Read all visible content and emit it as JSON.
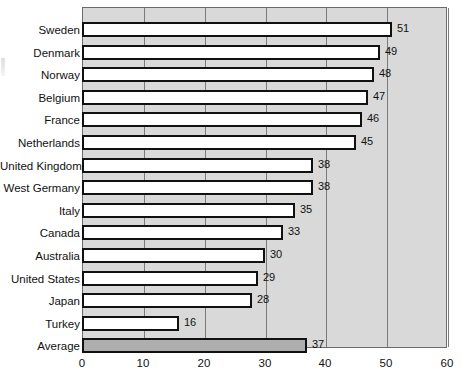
{
  "chart_data": {
    "type": "bar",
    "orientation": "horizontal",
    "title": "",
    "xlabel": "",
    "ylabel": "",
    "xlim": [
      0,
      60
    ],
    "xticks": [
      0,
      10,
      20,
      30,
      40,
      50,
      60
    ],
    "grid": true,
    "legend": false,
    "categories": [
      "Sweden",
      "Denmark",
      "Norway",
      "Belgium",
      "France",
      "Netherlands",
      "United Kingdom",
      "West Germany",
      "Italy",
      "Canada",
      "Australia",
      "United States",
      "Japan",
      "Turkey",
      "Average"
    ],
    "values": [
      51,
      49,
      48,
      47,
      46,
      45,
      38,
      38,
      35,
      33,
      30,
      29,
      28,
      16,
      37
    ],
    "value_labels": [
      "51",
      "49",
      "48",
      "47",
      "46",
      "45",
      "38",
      "38",
      "35",
      "33",
      "30",
      "29",
      "28",
      "16",
      "37"
    ],
    "highlight_category": "Average",
    "colors": {
      "bar_fill": "#ffffff",
      "bar_outline": "#111111",
      "average_bar_fill": "#aeaeae",
      "plot_background": "#d9d9d9",
      "gridline": "#7a7a7a",
      "page_background": "#ffffff",
      "text": "#111111"
    }
  }
}
